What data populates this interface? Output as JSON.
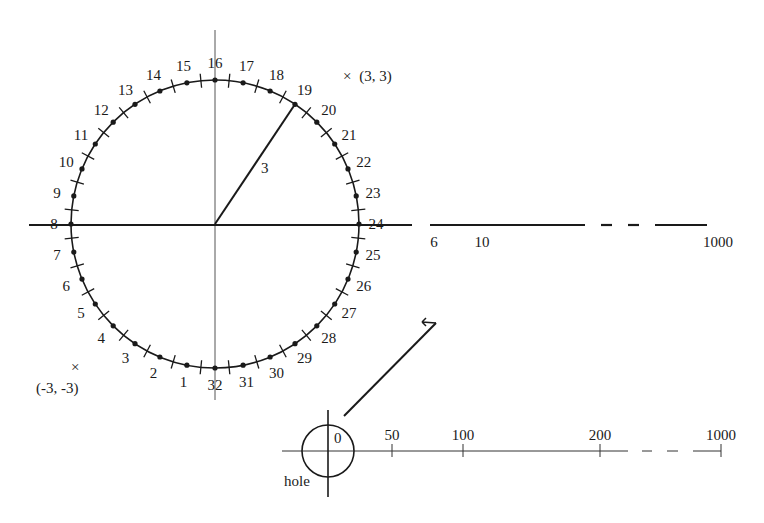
{
  "diagram": {
    "colors": {
      "ink": "#1a1a1a",
      "thin": "#444444",
      "background": "#ffffff"
    },
    "dial": {
      "center": [
        215,
        224
      ],
      "radius": 144,
      "point_count": 32,
      "point_labels": [
        "1",
        "2",
        "3",
        "4",
        "5",
        "6",
        "7",
        "8",
        "9",
        "10",
        "11",
        "12",
        "13",
        "14",
        "15",
        "16",
        "17",
        "18",
        "19",
        "20",
        "21",
        "22",
        "23",
        "24",
        "25",
        "26",
        "27",
        "28",
        "29",
        "30",
        "31",
        "32"
      ],
      "radius_label": "3",
      "radius_to_point": "19",
      "marker_upper": {
        "symbol": "×",
        "label": "(3, 3)"
      },
      "marker_lower": {
        "symbol": "×",
        "label": "(-3, -3)"
      }
    },
    "upper_axis": {
      "tick_labels": [
        {
          "text": "6",
          "x": 434
        },
        {
          "text": "10",
          "x": 482
        },
        {
          "text": "1000",
          "x": 718
        }
      ]
    },
    "lower_scale": {
      "hole_label": "hole",
      "zero_label": "0",
      "ticks": [
        {
          "text": "50",
          "x": 392
        },
        {
          "text": "100",
          "x": 463
        },
        {
          "text": "200",
          "x": 600
        },
        {
          "text": "1000",
          "x": 721
        }
      ],
      "arrow_symbol": "↩"
    }
  }
}
